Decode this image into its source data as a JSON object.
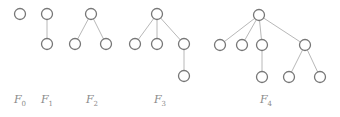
{
  "diagram": {
    "node_radius": 5.5,
    "colors": {
      "node_stroke": "#777777",
      "edge": "#b8b8b8",
      "label": "#8a8a8a",
      "background": "#ffffff"
    },
    "trees": [
      {
        "name": "F0",
        "base": "F",
        "sub": "0",
        "label_x": 20,
        "nodes": [
          {
            "id": "a",
            "x": 20,
            "y": 14
          }
        ],
        "edges": []
      },
      {
        "name": "F1",
        "base": "F",
        "sub": "1",
        "label_x": 47,
        "nodes": [
          {
            "id": "a",
            "x": 47,
            "y": 14
          },
          {
            "id": "b",
            "x": 47,
            "y": 44
          }
        ],
        "edges": [
          [
            "a",
            "b"
          ]
        ]
      },
      {
        "name": "F2",
        "base": "F",
        "sub": "2",
        "label_x": 92,
        "nodes": [
          {
            "id": "a",
            "x": 91,
            "y": 14
          },
          {
            "id": "b",
            "x": 75,
            "y": 44
          },
          {
            "id": "c",
            "x": 106,
            "y": 44
          }
        ],
        "edges": [
          [
            "a",
            "b"
          ],
          [
            "a",
            "c"
          ]
        ]
      },
      {
        "name": "F3",
        "base": "F",
        "sub": "3",
        "label_x": 160,
        "nodes": [
          {
            "id": "a",
            "x": 157,
            "y": 14
          },
          {
            "id": "b",
            "x": 135,
            "y": 44
          },
          {
            "id": "c",
            "x": 157,
            "y": 44
          },
          {
            "id": "d",
            "x": 184,
            "y": 44
          },
          {
            "id": "e",
            "x": 184,
            "y": 76
          }
        ],
        "edges": [
          [
            "a",
            "b"
          ],
          [
            "a",
            "c"
          ],
          [
            "a",
            "d"
          ],
          [
            "d",
            "e"
          ]
        ]
      },
      {
        "name": "F4",
        "base": "F",
        "sub": "4",
        "label_x": 266,
        "nodes": [
          {
            "id": "a",
            "x": 259,
            "y": 15
          },
          {
            "id": "b",
            "x": 220,
            "y": 45
          },
          {
            "id": "c",
            "x": 242,
            "y": 45
          },
          {
            "id": "d",
            "x": 262,
            "y": 45
          },
          {
            "id": "e",
            "x": 305,
            "y": 45
          },
          {
            "id": "f",
            "x": 262,
            "y": 77
          },
          {
            "id": "g",
            "x": 289,
            "y": 77
          },
          {
            "id": "h",
            "x": 320,
            "y": 77
          }
        ],
        "edges": [
          [
            "a",
            "b"
          ],
          [
            "a",
            "c"
          ],
          [
            "a",
            "d"
          ],
          [
            "a",
            "e"
          ],
          [
            "d",
            "f"
          ],
          [
            "e",
            "g"
          ],
          [
            "e",
            "h"
          ]
        ]
      }
    ],
    "label_y": 93
  }
}
